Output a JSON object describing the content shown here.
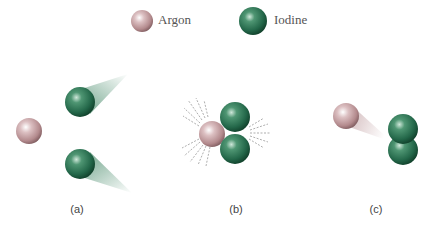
{
  "legend": {
    "argon_label": "Argon",
    "iodine_label": "Iodine"
  },
  "panels": [
    {
      "id": "a",
      "label": "(a)",
      "description": "Argon atom with two separate iodine atoms moving apart"
    },
    {
      "id": "b",
      "label": "(b)",
      "description": "Argon colliding with two iodine atoms, absorbing energy"
    },
    {
      "id": "c",
      "label": "(c)",
      "description": "Argon moving away from bonded iodine molecule I2"
    }
  ],
  "colors": {
    "argon": "#c9a3a6",
    "argon_dark": "#8d6a6d",
    "iodine": "#2e7a55",
    "iodine_dark": "#164d33"
  }
}
